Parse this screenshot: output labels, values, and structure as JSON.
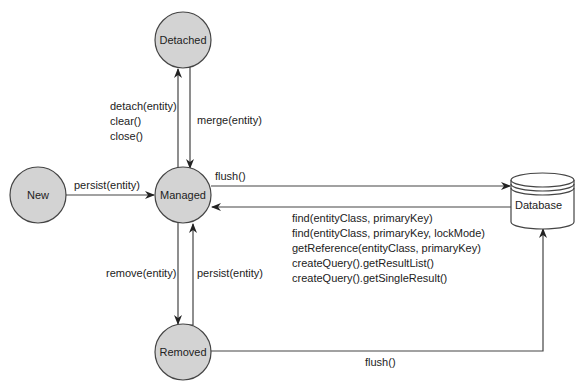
{
  "diagram": {
    "type": "state-diagram",
    "colors": {
      "state_fill": "#d3d3d3",
      "stroke": "#444444",
      "background": "#ffffff"
    },
    "states": [
      {
        "id": "new",
        "label": "New"
      },
      {
        "id": "managed",
        "label": "Managed"
      },
      {
        "id": "detached",
        "label": "Detached"
      },
      {
        "id": "removed",
        "label": "Removed"
      }
    ],
    "database": {
      "label": "Database",
      "shape": "cylinder"
    },
    "transitions": {
      "new_to_managed": {
        "label": "persist(entity)"
      },
      "managed_to_detached": {
        "lines": [
          "detach(entity)",
          "clear()",
          "close()"
        ]
      },
      "detached_to_managed": {
        "label": "merge(entity)"
      },
      "managed_to_database": {
        "label": "flush()"
      },
      "database_to_managed": {
        "lines": [
          "find(entityClass, primaryKey)",
          "find(entityClass, primaryKey, lockMode)",
          "getReference(entityClass, primaryKey)",
          "createQuery().getResultList()",
          "createQuery().getSingleResult()"
        ]
      },
      "managed_to_removed": {
        "label": "remove(entity)"
      },
      "removed_to_managed": {
        "label": "persist(entity)"
      },
      "removed_to_database": {
        "label": "flush()"
      }
    }
  }
}
